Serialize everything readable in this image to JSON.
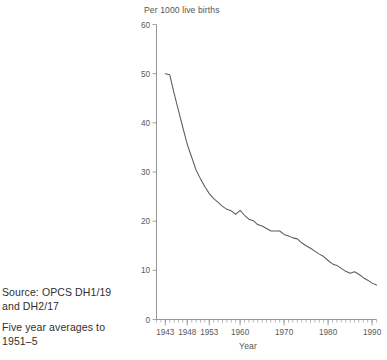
{
  "figure": {
    "caption_source": {
      "line1": "Source: OPCS DH1/19",
      "line2": "and DH2/17"
    },
    "caption_note": {
      "line1": "Five year averages to",
      "line2": "1951–5"
    }
  },
  "chart_data": {
    "type": "line",
    "title": "Per 1000 live births",
    "xlabel": "Year",
    "ylabel": "",
    "xlim": [
      1941,
      1991
    ],
    "ylim": [
      0,
      60
    ],
    "ytick_labels": [
      "0",
      "10",
      "20",
      "30",
      "40",
      "50",
      "60"
    ],
    "yticks": [
      0,
      10,
      20,
      30,
      40,
      50,
      60
    ],
    "xtick_labels": [
      "1943",
      "1948",
      "1953",
      "1960",
      "1970",
      "1980",
      "1990"
    ],
    "xticks": [
      1943,
      1948,
      1953,
      1960,
      1970,
      1980,
      1990
    ],
    "grid": false,
    "legend": "none",
    "line_color": "#5c5c5c",
    "series": [
      {
        "name": "Infant mortality rate",
        "x": [
          1943,
          1944,
          1945,
          1946,
          1947,
          1948,
          1949,
          1950,
          1951,
          1952,
          1953,
          1954,
          1955,
          1956,
          1957,
          1958,
          1959,
          1960,
          1961,
          1962,
          1963,
          1964,
          1965,
          1966,
          1967,
          1968,
          1969,
          1970,
          1971,
          1972,
          1973,
          1974,
          1975,
          1976,
          1977,
          1978,
          1979,
          1980,
          1981,
          1982,
          1983,
          1984,
          1985,
          1986,
          1987,
          1988,
          1989,
          1990,
          1991
        ],
        "values": [
          50.0,
          49.8,
          46.0,
          42.5,
          39.0,
          35.6,
          33.0,
          30.4,
          28.6,
          27.0,
          25.6,
          24.6,
          23.8,
          23.0,
          22.4,
          22.1,
          21.4,
          22.2,
          21.2,
          20.4,
          20.1,
          19.3,
          19.0,
          18.5,
          18.0,
          18.0,
          18.0,
          17.3,
          17.0,
          16.6,
          16.4,
          15.6,
          15.0,
          14.5,
          13.9,
          13.3,
          12.8,
          12.0,
          11.3,
          11.0,
          10.4,
          9.8,
          9.4,
          9.7,
          9.2,
          8.5,
          8.0,
          7.4,
          7.0
        ],
        "units": "deaths per 1000 live births"
      }
    ],
    "annotations": {
      "start_value": 50.0,
      "end_value": 7.0,
      "start_year": 1943,
      "end_year": 1991
    }
  }
}
